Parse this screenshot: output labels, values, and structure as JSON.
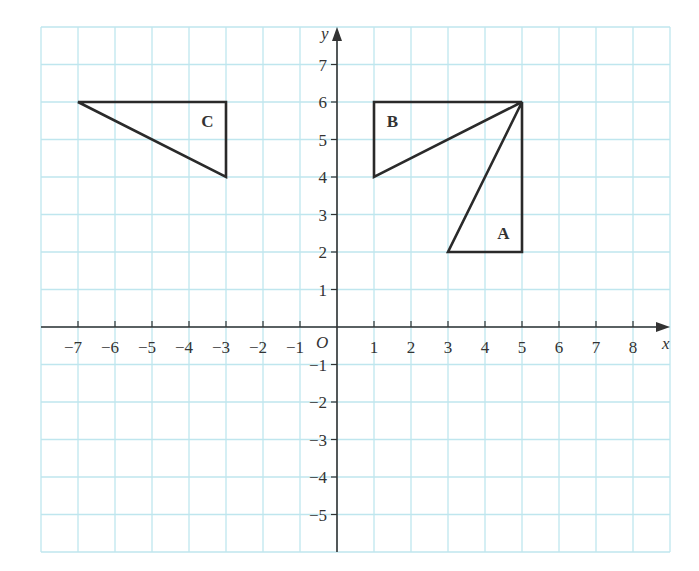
{
  "chart_data": {
    "type": "diagram",
    "title": "",
    "xlabel": "x",
    "ylabel": "y",
    "origin_label": "O",
    "xlim": [
      -8,
      9
    ],
    "ylim": [
      -6,
      8
    ],
    "grid": true,
    "x_ticks": [
      -7,
      -6,
      -5,
      -4,
      -3,
      -2,
      -1,
      1,
      2,
      3,
      4,
      5,
      6,
      7,
      8
    ],
    "y_ticks": [
      -5,
      -4,
      -3,
      -2,
      -1,
      1,
      2,
      3,
      4,
      5,
      6,
      7
    ],
    "shapes": [
      {
        "label": "A",
        "type": "triangle",
        "vertices": [
          [
            3,
            2
          ],
          [
            5,
            2
          ],
          [
            5,
            6
          ]
        ],
        "label_pos": [
          4.5,
          2.5
        ]
      },
      {
        "label": "B",
        "type": "triangle",
        "vertices": [
          [
            1,
            4
          ],
          [
            1,
            6
          ],
          [
            5,
            6
          ]
        ],
        "label_pos": [
          1.5,
          5.5
        ]
      },
      {
        "label": "C",
        "type": "triangle",
        "vertices": [
          [
            -7,
            6
          ],
          [
            -3,
            6
          ],
          [
            -3,
            4
          ]
        ],
        "label_pos": [
          -3.5,
          5.5
        ]
      }
    ]
  },
  "labels": {
    "x_axis": "x",
    "y_axis": "y",
    "origin": "O",
    "shape_a": "A",
    "shape_b": "B",
    "shape_c": "C"
  },
  "colors": {
    "grid": "#bfe6ee",
    "axis": "#333333",
    "shape_stroke": "#2a2a2a"
  }
}
